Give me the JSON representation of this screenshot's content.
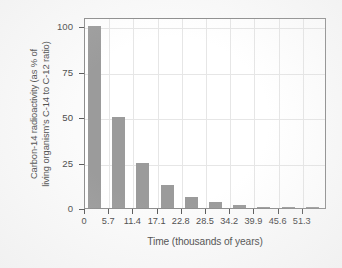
{
  "chart_data": {
    "type": "bar",
    "title": "",
    "xlabel": "Time (thousands of years)",
    "ylabel": "Carbon-14 radioactivity (as % of living organism's C-14 to C-12 ratio)",
    "ylabel_line1": "Carbon-14 radioactivity (as % of",
    "ylabel_line2": "living organism's C-14 to C-12 ratio)",
    "categories": [
      "0",
      "5.7",
      "11.4",
      "17.1",
      "22.8",
      "28.5",
      "34.2",
      "39.9",
      "45.6",
      "51.3"
    ],
    "values": [
      100,
      50,
      25,
      12.5,
      6.25,
      3.125,
      1.5625,
      0.78,
      0.39,
      0.195
    ],
    "xticklabels": [
      "0",
      "5.7",
      "11.4",
      "17.1",
      "22.8",
      "28.5",
      "34.2",
      "39.9",
      "45.6",
      "51.3"
    ],
    "yticklabels": [
      "0",
      "25",
      "50",
      "75",
      "100"
    ],
    "ytickvalues": [
      0,
      25,
      50,
      75,
      100
    ],
    "ylim": [
      0,
      105
    ],
    "grid": true,
    "legend": "none",
    "bar_color": "#9b9b9b",
    "grid_color": "#e6e6e6",
    "axis_color": "#8d8d8d",
    "text_color": "#4a4a4a",
    "plot_background": "#ffffff",
    "figure_background": "#fbfbfb"
  }
}
